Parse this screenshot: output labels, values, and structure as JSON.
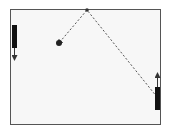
{
  "game": {
    "type": "pong",
    "court": {
      "left": 10,
      "top": 9,
      "right": 161,
      "bottom": 125,
      "border_color": "#555555",
      "background": "#f7f7f7"
    },
    "left_paddle": {
      "x": 12,
      "y": 25,
      "width": 5,
      "height": 23,
      "color": "#111111",
      "direction": "down",
      "arrow_to_y": 58
    },
    "right_paddle": {
      "x": 155,
      "y": 87,
      "width": 5,
      "height": 23,
      "color": "#111111",
      "direction": "up",
      "arrow_to_y": 75
    },
    "ball": {
      "cx": 59,
      "cy": 43,
      "r": 3,
      "color": "#222222"
    },
    "trajectory": {
      "points": [
        [
          59,
          43
        ],
        [
          87,
          10
        ],
        [
          157,
          97
        ]
      ],
      "style": "dashed",
      "color": "#555555"
    }
  }
}
